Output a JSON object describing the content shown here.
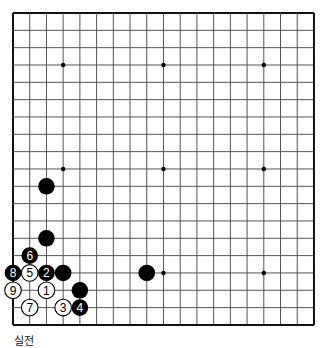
{
  "board": {
    "size": 19,
    "origin_x": 13,
    "origin_y": 13,
    "step_x": 16.72,
    "step_y": 17.33,
    "line_color": "#555555",
    "border_color": "#111111",
    "star_points": [
      [
        3,
        3
      ],
      [
        9,
        3
      ],
      [
        15,
        3
      ],
      [
        3,
        9
      ],
      [
        9,
        9
      ],
      [
        15,
        9
      ],
      [
        3,
        15
      ],
      [
        9,
        15
      ],
      [
        15,
        15
      ]
    ],
    "stones": [
      {
        "color": "black",
        "col": 2,
        "row": 10,
        "label": ""
      },
      {
        "color": "black",
        "col": 2,
        "row": 13,
        "label": ""
      },
      {
        "color": "black",
        "col": 1,
        "row": 14,
        "label": "6"
      },
      {
        "color": "black",
        "col": 0,
        "row": 15,
        "label": "8"
      },
      {
        "color": "white",
        "col": 1,
        "row": 15,
        "label": "5"
      },
      {
        "color": "black",
        "col": 2,
        "row": 15,
        "label": "2"
      },
      {
        "color": "black",
        "col": 3,
        "row": 15,
        "label": ""
      },
      {
        "color": "black",
        "col": 8,
        "row": 15,
        "label": ""
      },
      {
        "color": "white",
        "col": 0,
        "row": 16,
        "label": "9"
      },
      {
        "color": "white",
        "col": 2,
        "row": 16,
        "label": "1"
      },
      {
        "color": "black",
        "col": 4,
        "row": 16,
        "label": ""
      },
      {
        "color": "white",
        "col": 1,
        "row": 17,
        "label": "7"
      },
      {
        "color": "white",
        "col": 3,
        "row": 17,
        "label": "3"
      },
      {
        "color": "black",
        "col": 4,
        "row": 17,
        "label": "4"
      }
    ]
  },
  "caption": "실전"
}
